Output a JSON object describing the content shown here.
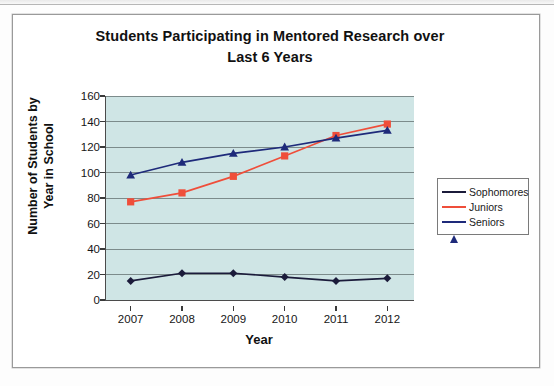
{
  "chart_data": {
    "type": "line",
    "title": "Students Participating in Mentored Research over Last 6 Years",
    "title_line1": "Students Participating in Mentored Research over",
    "title_line2": "Last 6 Years",
    "xlabel": "Year",
    "ylabel": "Number of Students by Year in School",
    "ylabel_line1": "Number of Students by",
    "ylabel_line2": "Year in School",
    "categories": [
      "2007",
      "2008",
      "2009",
      "2010",
      "2011",
      "2012"
    ],
    "ylim": [
      0,
      160
    ],
    "yticks": [
      0,
      20,
      40,
      60,
      80,
      100,
      120,
      140,
      160
    ],
    "ytick_labels": [
      "0",
      "20",
      "40",
      "60",
      "80",
      "100",
      "120",
      "140",
      "160"
    ],
    "grid": true,
    "legend_position": "right",
    "plot_background": "#cfe5e5",
    "series": [
      {
        "name": "Sophomores",
        "color": "#1b1b3a",
        "marker": "diamond",
        "values": [
          15,
          21,
          21,
          18,
          15,
          17
        ]
      },
      {
        "name": "Juniors",
        "color": "#ef4e3a",
        "marker": "square",
        "values": [
          77,
          84,
          97,
          113,
          129,
          138
        ]
      },
      {
        "name": "Seniors",
        "color": "#1e2a7a",
        "marker": "triangle",
        "values": [
          98,
          108,
          115,
          120,
          127,
          133
        ]
      }
    ]
  },
  "legend": {
    "items": [
      {
        "label": "Sophomores"
      },
      {
        "label": "Juniors"
      },
      {
        "label": "Seniors"
      }
    ]
  }
}
